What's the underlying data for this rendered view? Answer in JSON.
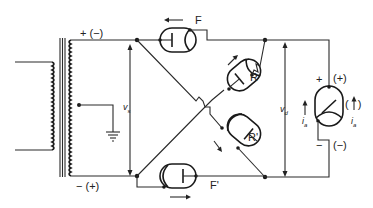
{
  "diagram": {
    "type": "full-wave bridge rectifier with four vacuum diodes",
    "transformer": {
      "top_terminal_polarity": "+ (−)",
      "bottom_terminal_polarity": "− (+)",
      "center_tap": "ground",
      "voltage_label": "v",
      "voltage_subscript": "s"
    },
    "diodes": [
      {
        "id": "F",
        "label": "F",
        "position": "top"
      },
      {
        "id": "R",
        "label": "R",
        "position": "upper-right diagonal"
      },
      {
        "id": "R'",
        "label": "R'",
        "position": "lower-right diagonal"
      },
      {
        "id": "F'",
        "label": "F'",
        "position": "bottom"
      }
    ],
    "output": {
      "voltage_label": "v",
      "voltage_subscript": "d",
      "load_top_polarity": "+",
      "load_top_polarity_alt": "(+)",
      "load_bottom_polarity": "−",
      "load_bottom_polarity_alt": "(−)",
      "current_label": "i",
      "current_subscript": "a",
      "current_label_alt": "i",
      "current_alt_subscript": "a",
      "current_arrow_alt": "(↑)"
    },
    "colors": {
      "ink": "#222222",
      "background": "#ffffff"
    }
  }
}
